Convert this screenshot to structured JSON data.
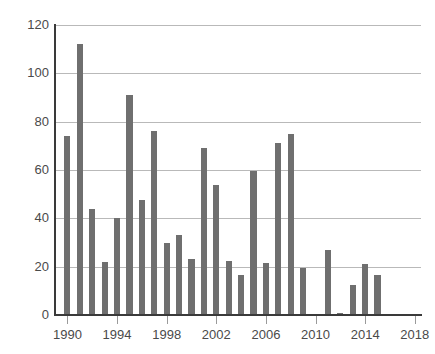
{
  "chart_data": {
    "type": "bar",
    "title": "",
    "subtitle": "",
    "xlabel": "",
    "ylabel": "",
    "xlim": [
      1989,
      2018.5
    ],
    "ylim": [
      0,
      120
    ],
    "grid": true,
    "legend": null,
    "bar_color": "#6f6f6f",
    "axis_color": "#3a3a3a",
    "gridline_color": "#b9b9b9",
    "tick_label_color": "#4a4a4a",
    "y_ticks": [
      0,
      20,
      40,
      60,
      80,
      100,
      120
    ],
    "y_tick_labels": [
      "0",
      "20",
      "40",
      "60",
      "80",
      "100",
      "120"
    ],
    "x_ticks": [
      1990,
      1994,
      1998,
      2002,
      2006,
      2010,
      2014,
      2018
    ],
    "x_tick_labels": [
      "1990",
      "1994",
      "1998",
      "2002",
      "2006",
      "2010",
      "2014",
      "2018"
    ],
    "categories": [
      "1990",
      "1991",
      "1992",
      "1993",
      "1994",
      "1995",
      "1996",
      "1997",
      "1998",
      "1999",
      "2000",
      "2001",
      "2002",
      "2003",
      "2004",
      "2005",
      "2006",
      "2007",
      "2008",
      "2009",
      "2010",
      "2011",
      "2012",
      "2013",
      "2014",
      "2015"
    ],
    "values": [
      74,
      112,
      44,
      22,
      40,
      91,
      47.5,
      76,
      30,
      33,
      23,
      69,
      54,
      22.5,
      16.5,
      59.5,
      21.5,
      71,
      75,
      19.5,
      0.5,
      27,
      1,
      12.5,
      21,
      16.5
    ]
  }
}
